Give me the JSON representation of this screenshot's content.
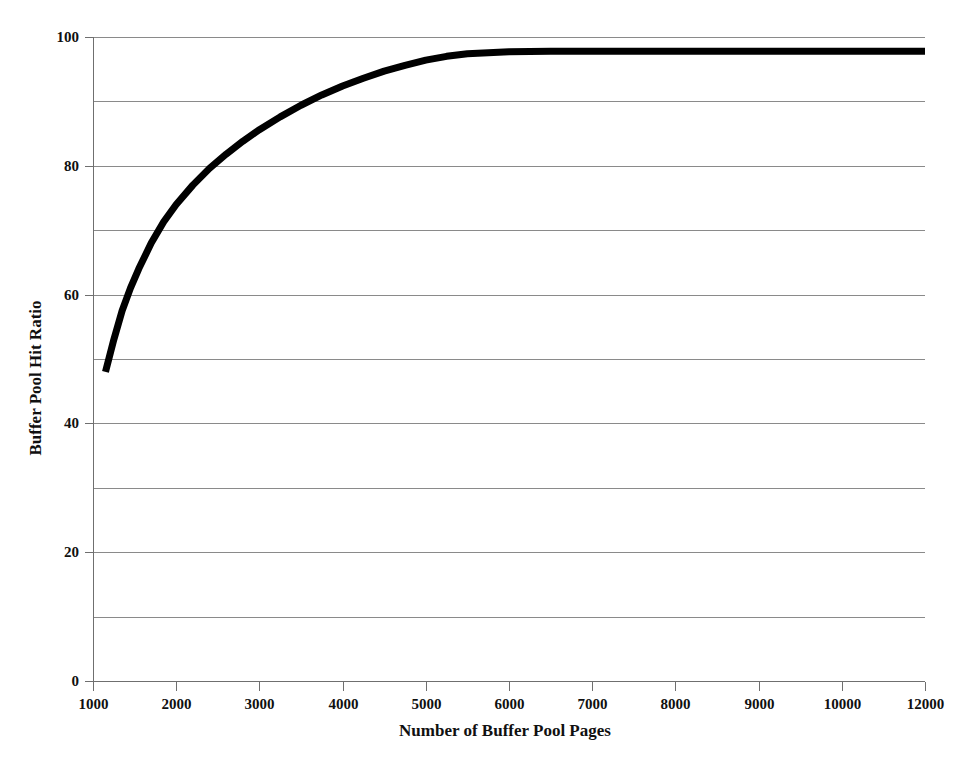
{
  "chart_data": {
    "type": "line",
    "title": "",
    "xlabel": "Number of Buffer Pool Pages",
    "ylabel": "Buffer Pool Hit Ratio",
    "xlim": [
      1000,
      12000
    ],
    "ylim": [
      0,
      100
    ],
    "grid": true,
    "legend": "none",
    "x_tick_labels": [
      "1000",
      "2000",
      "3000",
      "4000",
      "5000",
      "6000",
      "7000",
      "8000",
      "9000",
      "10000",
      "12000"
    ],
    "y_tick_labels": [
      "0",
      "20",
      "40",
      "60",
      "80",
      "100"
    ],
    "y_gridline_values": [
      0,
      10,
      20,
      30,
      40,
      50,
      60,
      70,
      80,
      90,
      100
    ],
    "y_major_tick_values": [
      0,
      20,
      40,
      60,
      80,
      100
    ],
    "series": [
      {
        "name": "Buffer Pool Hit Ratio",
        "color": "#000000",
        "x": [
          1150,
          1250,
          1350,
          1450,
          1550,
          1700,
          1850,
          2000,
          2200,
          2400,
          2600,
          2800,
          3000,
          3250,
          3500,
          3750,
          4000,
          4250,
          4500,
          4750,
          5000,
          5250,
          5500,
          6000,
          6500,
          7000,
          7500,
          8000,
          8500,
          9000,
          9500,
          10000,
          10500,
          11000,
          11500,
          12000
        ],
        "y": [
          48.0,
          53.0,
          57.5,
          61.0,
          64.0,
          68.0,
          71.3,
          74.0,
          77.0,
          79.6,
          81.8,
          83.8,
          85.6,
          87.6,
          89.4,
          91.0,
          92.4,
          93.6,
          94.7,
          95.6,
          96.4,
          97.0,
          97.4,
          97.7,
          97.8,
          97.8,
          97.8,
          97.8,
          97.8,
          97.8,
          97.8,
          97.8,
          97.8,
          97.8,
          97.8,
          97.8
        ]
      }
    ]
  },
  "figure": {
    "background_color": "#ffffff",
    "gridline_color": "#8a8a8a",
    "axis_color": "#6f6f6f",
    "curve_color": "#000000"
  }
}
